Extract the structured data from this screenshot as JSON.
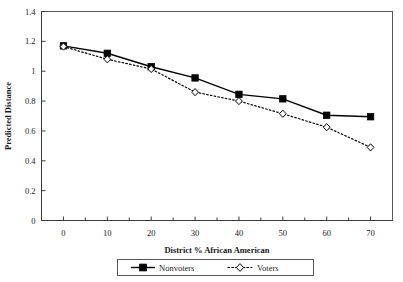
{
  "chart_data": {
    "type": "line",
    "title": "",
    "xlabel": "District % African American",
    "ylabel": "Predicted Distance",
    "x": [
      0,
      10,
      20,
      30,
      40,
      50,
      60,
      70
    ],
    "xlim": [
      -5,
      75
    ],
    "ylim": [
      0,
      1.4
    ],
    "xticks": [
      "0",
      "10",
      "20",
      "30",
      "40",
      "50",
      "60",
      "70"
    ],
    "yticks": [
      "0",
      "0.2",
      "0.4",
      "0.6",
      "0.8",
      "1",
      "1.2",
      "1.4"
    ],
    "grid": false,
    "legend_position": "bottom",
    "series": [
      {
        "name": "Nonvoters",
        "marker": "filled-square",
        "line_style": "solid",
        "color": "#000000",
        "values": [
          1.17,
          1.12,
          1.03,
          0.955,
          0.845,
          0.815,
          0.705,
          0.695
        ]
      },
      {
        "name": "Voters",
        "marker": "open-diamond",
        "line_style": "dotted",
        "color": "#000000",
        "values": [
          1.165,
          1.08,
          1.015,
          0.86,
          0.8,
          0.715,
          0.625,
          0.49
        ]
      }
    ]
  },
  "axes": {
    "y_title": "Predicted Distance",
    "x_title": "District % African American"
  },
  "legend": {
    "items": [
      {
        "label": "Nonvoters"
      },
      {
        "label": "Voters"
      }
    ]
  }
}
